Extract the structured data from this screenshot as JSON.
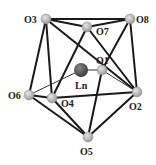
{
  "diagram": {
    "center": {
      "id": "Ln",
      "label": "Ln",
      "x": 81,
      "y": 70,
      "r": 7,
      "color": "#555555",
      "label_x": 75,
      "label_y": 89
    },
    "atoms": [
      {
        "id": "O3",
        "label": "O3",
        "x": 46,
        "y": 19,
        "label_x": 24,
        "label_y": 23
      },
      {
        "id": "O8",
        "label": "O8",
        "x": 130,
        "y": 19,
        "label_x": 136,
        "label_y": 23
      },
      {
        "id": "O7",
        "label": "O7",
        "x": 87,
        "y": 27,
        "label_x": 96,
        "label_y": 35
      },
      {
        "id": "O1",
        "label": "O1",
        "x": 102,
        "y": 70,
        "label_x": 96,
        "label_y": 64
      },
      {
        "id": "O6",
        "label": "O6",
        "x": 29,
        "y": 95,
        "label_x": 8,
        "label_y": 99
      },
      {
        "id": "O4",
        "label": "O4",
        "x": 52,
        "y": 98,
        "label_x": 61,
        "label_y": 107
      },
      {
        "id": "O2",
        "label": "O2",
        "x": 137,
        "y": 92,
        "label_x": 129,
        "label_y": 110
      },
      {
        "id": "O5",
        "label": "O5",
        "x": 88,
        "y": 137,
        "label_x": 80,
        "label_y": 155
      }
    ],
    "bonds": [
      [
        "O3",
        "O8"
      ],
      [
        "O3",
        "O7"
      ],
      [
        "O7",
        "O8"
      ],
      [
        "O3",
        "O6"
      ],
      [
        "O3",
        "O4"
      ],
      [
        "O3",
        "O2"
      ],
      [
        "O7",
        "O4"
      ],
      [
        "O7",
        "O2"
      ],
      [
        "O8",
        "O1"
      ],
      [
        "O8",
        "O2"
      ],
      [
        "O6",
        "O4"
      ],
      [
        "O6",
        "O5"
      ],
      [
        "O4",
        "O5"
      ],
      [
        "O4",
        "O2"
      ],
      [
        "O2",
        "O5"
      ],
      [
        "O1",
        "O5"
      ]
    ],
    "thin_bonds": [
      [
        "O6",
        "Ln"
      ],
      [
        "Ln",
        "O1"
      ],
      [
        "O1",
        "O2"
      ]
    ],
    "colors": {
      "oxygen": "#b0b0b0",
      "bond": "#1a1a1a",
      "thin_bond": "#333333"
    }
  }
}
